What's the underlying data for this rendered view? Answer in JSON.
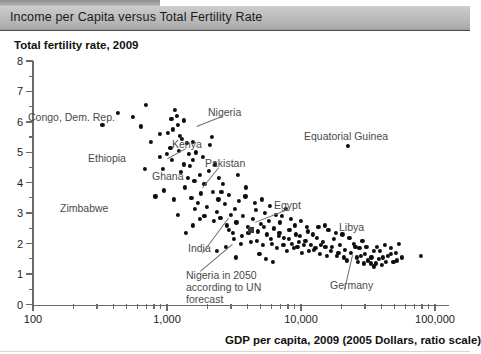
{
  "titlebar": {
    "title": "Income per Capita versus Total Fertility Rate"
  },
  "chart_data": {
    "type": "scatter",
    "title": "Income per Capita versus Total Fertility Rate",
    "ylabel": "Total fertility rate, 2009",
    "xlabel": "GDP per capita, 2009 (2005 Dollars, ratio scale)",
    "xscale": "log",
    "xlim": [
      100,
      100000
    ],
    "ylim": [
      0,
      8
    ],
    "grid": false,
    "legend": null,
    "x_tick_labels": [
      "100",
      "1,000",
      "10,000",
      "100,000"
    ],
    "x_tick_values": [
      100,
      1000,
      10000,
      100000
    ],
    "y_tick_labels": [
      "0",
      "1",
      "2",
      "3",
      "4",
      "5",
      "6",
      "7",
      "8"
    ],
    "y_tick_values": [
      0,
      1,
      2,
      3,
      4,
      5,
      6,
      7,
      8
    ],
    "y_minor_step": 0.5,
    "annotations": [
      {
        "label": "Congo, Dem. Rep.",
        "x": 320,
        "y": 5.95,
        "leader": false
      },
      {
        "label": "Ethiopia",
        "x": 950,
        "y": 4.75,
        "leader": false
      },
      {
        "label": "Zimbabwe",
        "x": 420,
        "y": 3.35,
        "leader": false
      },
      {
        "label": "Kenya",
        "x": 1600,
        "y": 4.85,
        "leader": true
      },
      {
        "label": "Ghana",
        "x": 1450,
        "y": 3.95,
        "leader": false
      },
      {
        "label": "Nigeria",
        "x": 2150,
        "y": 5.55,
        "leader": true
      },
      {
        "label": "Pakistan",
        "x": 2700,
        "y": 4.35,
        "leader": true
      },
      {
        "label": "India",
        "x": 2850,
        "y": 2.55,
        "leader": true
      },
      {
        "label": "Egypt",
        "x": 5600,
        "y": 3.05,
        "leader": true
      },
      {
        "label": "Equatorial Guinea",
        "x": 22000,
        "y": 5.2,
        "leader": false
      },
      {
        "label": "Libya",
        "x": 16000,
        "y": 2.5,
        "leader": false
      },
      {
        "label": "Germany",
        "x": 34000,
        "y": 1.35,
        "leader": true
      },
      {
        "label": "Nigeria in 2050 according to UN forecast",
        "x": 4200,
        "y": 1.95,
        "leader": true
      }
    ],
    "special_markers": [
      {
        "name": "Nigeria in 2050 according to UN forecast",
        "x": 4200,
        "y": 2.45,
        "marker": "square"
      }
    ],
    "points": [
      [
        330,
        5.9
      ],
      [
        430,
        6.3
      ],
      [
        560,
        6.15
      ],
      [
        640,
        5.85
      ],
      [
        700,
        6.55
      ],
      [
        760,
        5.35
      ],
      [
        880,
        5.6
      ],
      [
        930,
        4.45
      ],
      [
        1000,
        4.95
      ],
      [
        1060,
        5.15
      ],
      [
        1080,
        6.1
      ],
      [
        1150,
        6.4
      ],
      [
        1180,
        6.2
      ],
      [
        1200,
        5.9
      ],
      [
        1220,
        5.05
      ],
      [
        1270,
        4.35
      ],
      [
        1300,
        5.45
      ],
      [
        1330,
        4.6
      ],
      [
        1360,
        3.85
      ],
      [
        1400,
        5.3
      ],
      [
        1430,
        4.15
      ],
      [
        1480,
        4.55
      ],
      [
        1520,
        3.5
      ],
      [
        1560,
        4.75
      ],
      [
        1600,
        4.05
      ],
      [
        1650,
        5.0
      ],
      [
        1700,
        3.35
      ],
      [
        1760,
        4.25
      ],
      [
        1800,
        3.65
      ],
      [
        1850,
        4.85
      ],
      [
        1900,
        3.95
      ],
      [
        1980,
        3.2
      ],
      [
        2050,
        4.4
      ],
      [
        2100,
        5.25
      ],
      [
        2200,
        3.7
      ],
      [
        2280,
        4.6
      ],
      [
        2350,
        3.05
      ],
      [
        2420,
        3.45
      ],
      [
        2500,
        2.85
      ],
      [
        2600,
        3.95
      ],
      [
        2700,
        3.3
      ],
      [
        2800,
        2.6
      ],
      [
        2900,
        3.6
      ],
      [
        3000,
        2.95
      ],
      [
        3100,
        2.35
      ],
      [
        3200,
        3.15
      ],
      [
        3300,
        2.7
      ],
      [
        3450,
        3.4
      ],
      [
        3600,
        2.25
      ],
      [
        3700,
        2.9
      ],
      [
        3850,
        3.55
      ],
      [
        4000,
        2.55
      ],
      [
        4200,
        2.05
      ],
      [
        4400,
        2.8
      ],
      [
        4600,
        3.1
      ],
      [
        4800,
        2.4
      ],
      [
        5000,
        2.65
      ],
      [
        5200,
        1.95
      ],
      [
        5400,
        3.0
      ],
      [
        5600,
        2.3
      ],
      [
        5800,
        2.75
      ],
      [
        6000,
        2.15
      ],
      [
        6300,
        2.5
      ],
      [
        6600,
        1.85
      ],
      [
        6900,
        2.35
      ],
      [
        7200,
        2.9
      ],
      [
        7500,
        2.2
      ],
      [
        7800,
        1.75
      ],
      [
        8200,
        2.45
      ],
      [
        8600,
        2.0
      ],
      [
        9000,
        2.6
      ],
      [
        9400,
        1.9
      ],
      [
        9800,
        2.25
      ],
      [
        10200,
        1.7
      ],
      [
        10800,
        2.1
      ],
      [
        11300,
        2.4
      ],
      [
        11900,
        1.95
      ],
      [
        12500,
        1.8
      ],
      [
        13100,
        2.2
      ],
      [
        13800,
        1.65
      ],
      [
        14500,
        2.05
      ],
      [
        15200,
        1.9
      ],
      [
        16000,
        2.45
      ],
      [
        16800,
        1.75
      ],
      [
        17600,
        2.15
      ],
      [
        18500,
        1.6
      ],
      [
        19400,
        1.95
      ],
      [
        20400,
        2.3
      ],
      [
        21400,
        1.8
      ],
      [
        22500,
        5.2
      ],
      [
        23600,
        1.7
      ],
      [
        24800,
        2.0
      ],
      [
        26000,
        1.55
      ],
      [
        27300,
        1.85
      ],
      [
        28700,
        2.1
      ],
      [
        30100,
        1.65
      ],
      [
        31600,
        1.45
      ],
      [
        33200,
        1.35
      ],
      [
        34900,
        1.75
      ],
      [
        36600,
        1.9
      ],
      [
        38400,
        1.5
      ],
      [
        40300,
        1.3
      ],
      [
        42300,
        1.95
      ],
      [
        44400,
        1.6
      ],
      [
        46600,
        1.85
      ],
      [
        48900,
        1.4
      ],
      [
        51300,
        1.7
      ],
      [
        53800,
        2.0
      ],
      [
        56500,
        1.55
      ],
      [
        78000,
        1.6
      ],
      [
        1100,
        5.75
      ],
      [
        1250,
        5.55
      ],
      [
        1340,
        6.05
      ],
      [
        1450,
        4.95
      ],
      [
        1550,
        5.35
      ],
      [
        890,
        4.85
      ],
      [
        1010,
        5.65
      ],
      [
        1090,
        4.75
      ],
      [
        2150,
        5.5
      ],
      [
        2450,
        4.15
      ],
      [
        3400,
        4.25
      ],
      [
        3900,
        3.85
      ],
      [
        4500,
        3.35
      ],
      [
        5100,
        3.45
      ],
      [
        5900,
        3.25
      ],
      [
        6500,
        2.95
      ],
      [
        7000,
        2.7
      ],
      [
        7700,
        3.15
      ],
      [
        8400,
        2.8
      ],
      [
        9100,
        2.3
      ],
      [
        2900,
        2.45
      ],
      [
        3150,
        2.15
      ],
      [
        3550,
        2.0
      ],
      [
        4050,
        2.35
      ],
      [
        4700,
        2.1
      ],
      [
        5300,
        2.55
      ],
      [
        6100,
        2.0
      ],
      [
        6800,
        2.25
      ],
      [
        7400,
        1.95
      ],
      [
        8100,
        2.15
      ],
      [
        8900,
        1.85
      ],
      [
        9600,
        2.05
      ],
      [
        10500,
        1.95
      ],
      [
        11500,
        1.75
      ],
      [
        12800,
        1.85
      ],
      [
        14000,
        1.95
      ],
      [
        15500,
        1.6
      ],
      [
        17000,
        1.9
      ],
      [
        19000,
        1.7
      ],
      [
        21000,
        1.55
      ],
      [
        23000,
        2.2
      ],
      [
        25500,
        1.9
      ],
      [
        28000,
        1.6
      ],
      [
        30800,
        1.9
      ],
      [
        33500,
        1.55
      ],
      [
        36000,
        1.35
      ],
      [
        39000,
        1.75
      ],
      [
        43000,
        1.4
      ],
      [
        47000,
        1.65
      ],
      [
        52000,
        1.45
      ],
      [
        1900,
        2.9
      ],
      [
        2250,
        2.75
      ],
      [
        2550,
        3.7
      ],
      [
        1750,
        2.8
      ],
      [
        1620,
        3.15
      ],
      [
        2350,
        1.75
      ],
      [
        2750,
        1.9
      ],
      [
        3250,
        1.55
      ],
      [
        1380,
        2.35
      ],
      [
        1550,
        2.6
      ],
      [
        680,
        4.45
      ],
      [
        820,
        3.55
      ],
      [
        1130,
        3.45
      ],
      [
        950,
        3.75
      ],
      [
        1210,
        2.95
      ],
      [
        4900,
        1.65
      ],
      [
        5500,
        1.5
      ],
      [
        6200,
        1.4
      ],
      [
        13500,
        2.55
      ],
      [
        15000,
        2.6
      ],
      [
        18200,
        2.35
      ],
      [
        12200,
        2.3
      ],
      [
        10000,
        2.75
      ],
      [
        11000,
        2.55
      ],
      [
        22000,
        1.45
      ],
      [
        26500,
        1.4
      ],
      [
        29500,
        1.35
      ],
      [
        35000,
        1.25
      ],
      [
        41000,
        1.55
      ]
    ]
  }
}
